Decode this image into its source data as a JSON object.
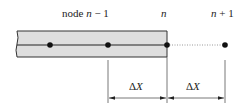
{
  "labels": {
    "node_prev": {
      "prefix": "node ",
      "var": "n",
      "suffix": " − 1"
    },
    "node_curr": {
      "var": "n"
    },
    "node_next": {
      "var": "n",
      "suffix": " + 1"
    },
    "dx_left": {
      "delta": "Δ",
      "var": "X"
    },
    "dx_right": {
      "delta": "Δ",
      "var": "X"
    }
  },
  "colors": {
    "rod_fill": "#dedede",
    "stroke": "#222222",
    "dotted": "#999999",
    "dim_line": "#555555"
  }
}
